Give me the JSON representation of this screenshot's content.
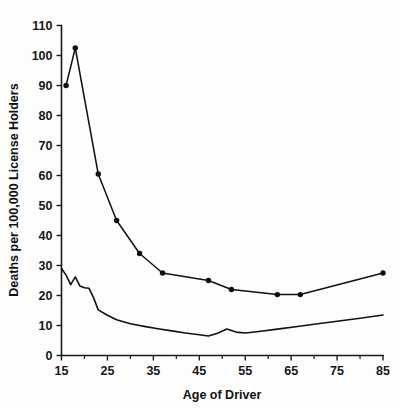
{
  "chart_data": {
    "type": "line",
    "title": "",
    "xlabel": "Age of Driver",
    "ylabel": "Deaths per 100,000 License Holders",
    "xlim": [
      15,
      85
    ],
    "ylim": [
      0,
      110
    ],
    "grid": false,
    "legend": "none",
    "y_ticks": [
      0,
      10,
      20,
      30,
      40,
      50,
      60,
      70,
      80,
      90,
      100,
      110
    ],
    "y_tick_labels": [
      "0",
      "10",
      "20",
      "30",
      "40",
      "50",
      "60",
      "70",
      "80",
      "90",
      "100",
      "110"
    ],
    "x_ticks": [
      15,
      25,
      35,
      45,
      55,
      65,
      75,
      85
    ],
    "x_tick_labels": [
      "15",
      "25",
      "35",
      "45",
      "55",
      "65",
      "75",
      "85"
    ],
    "x_minor_ticks": [
      20,
      30,
      40,
      50,
      60,
      70,
      80
    ],
    "series": [
      {
        "name": "upper-series-with-markers",
        "markers": true,
        "color": "#111111",
        "x": [
          16,
          18,
          23,
          27,
          32,
          37,
          47,
          52,
          62,
          67,
          85
        ],
        "values": [
          90,
          102.5,
          60.5,
          45,
          34,
          27.5,
          25,
          22,
          20.3,
          20.3,
          27.5
        ]
      },
      {
        "name": "lower-series-no-markers",
        "markers": false,
        "color": "#111111",
        "x": [
          15,
          16,
          17,
          18,
          19,
          20,
          21,
          22,
          23,
          25,
          27,
          30,
          33,
          36,
          39,
          42,
          45,
          47,
          49,
          51,
          53,
          55,
          58,
          62,
          66,
          70,
          75,
          80,
          85
        ],
        "values": [
          29,
          26.8,
          23.6,
          26.2,
          23.2,
          22.6,
          22.4,
          19.2,
          15.2,
          13.4,
          11.9,
          10.6,
          9.7,
          8.9,
          8.2,
          7.5,
          6.9,
          6.5,
          7.4,
          8.8,
          7.8,
          7.5,
          8.0,
          8.8,
          9.6,
          10.4,
          11.4,
          12.4,
          13.5
        ]
      }
    ]
  },
  "figure": {
    "background_color": "#fdfdfd",
    "foreground_color": "#111111"
  }
}
